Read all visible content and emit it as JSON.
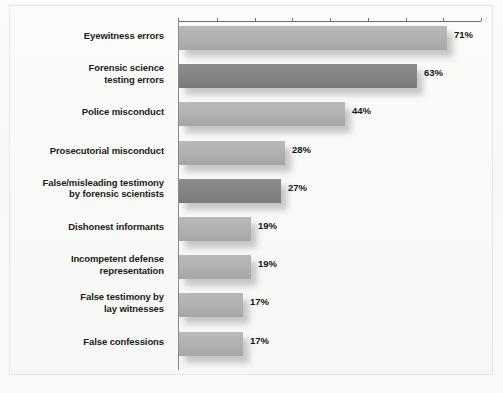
{
  "chart_data": {
    "type": "bar",
    "orientation": "horizontal",
    "title": "",
    "xlabel": "",
    "ylabel": "",
    "xlim": [
      0,
      80
    ],
    "grid": false,
    "legend": null,
    "axis_position": "top",
    "tick_values": [
      0,
      10,
      20,
      30,
      40,
      50,
      60,
      70,
      80
    ],
    "categories": [
      "Eyewitness errors",
      "Forensic science\ntesting errors",
      "Police misconduct",
      "Prosecutorial misconduct",
      "False/misleading testimony\nby forensic scientists",
      "Dishonest informants",
      "Incompetent defense\nrepresentation",
      "False testimony by\nlay witnesses",
      "False confessions"
    ],
    "values": [
      71,
      63,
      44,
      28,
      27,
      19,
      19,
      17,
      17
    ],
    "value_labels": [
      "71%",
      "63%",
      "44%",
      "28%",
      "27%",
      "19%",
      "19%",
      "17%",
      "17%"
    ],
    "bar_shades": [
      "light",
      "dark",
      "light",
      "light",
      "dark",
      "light",
      "light",
      "light",
      "light"
    ]
  },
  "colors": {
    "bar_light": "#b2b2b2",
    "bar_dark": "#858585",
    "axis": "#6e6e6e",
    "text": "#1b1b1b",
    "page": "#fbfbf9"
  },
  "rows": [
    {
      "label_line1": "Eyewitness errors",
      "label_line2": "",
      "value": 71,
      "value_label": "71%",
      "shade": "light"
    },
    {
      "label_line1": "Forensic science",
      "label_line2": "testing errors",
      "value": 63,
      "value_label": "63%",
      "shade": "dark"
    },
    {
      "label_line1": "Police misconduct",
      "label_line2": "",
      "value": 44,
      "value_label": "44%",
      "shade": "light"
    },
    {
      "label_line1": "Prosecutorial misconduct",
      "label_line2": "",
      "value": 28,
      "value_label": "28%",
      "shade": "light"
    },
    {
      "label_line1": "False/misleading testimony",
      "label_line2": "by forensic scientists",
      "value": 27,
      "value_label": "27%",
      "shade": "dark"
    },
    {
      "label_line1": "Dishonest informants",
      "label_line2": "",
      "value": 19,
      "value_label": "19%",
      "shade": "light"
    },
    {
      "label_line1": "Incompetent defense",
      "label_line2": "representation",
      "value": 19,
      "value_label": "19%",
      "shade": "light"
    },
    {
      "label_line1": "False testimony by",
      "label_line2": "lay witnesses",
      "value": 17,
      "value_label": "17%",
      "shade": "light"
    },
    {
      "label_line1": "False confessions",
      "label_line2": "",
      "value": 17,
      "value_label": "17%",
      "shade": "light"
    }
  ],
  "caption": ""
}
